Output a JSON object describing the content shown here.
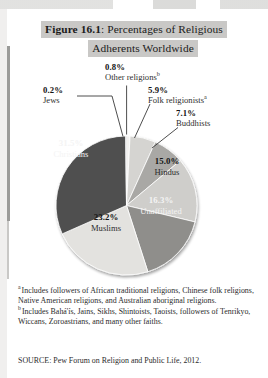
{
  "figure": {
    "title_label": "Figure 16.1",
    "title_rest": ": Percentages of Religious",
    "title_line2": "Adherents Worldwide"
  },
  "chart_data": {
    "type": "pie",
    "title": "Figure 16.1: Percentages of Religious Adherents Worldwide",
    "units": "percent",
    "legend": "none",
    "labels_inside": [
      "Christians",
      "Muslims",
      "Unaffiliated",
      "Hindus"
    ],
    "labels_outside": [
      "Other religions",
      "Jews",
      "Folk religionists",
      "Buddhists"
    ],
    "categories": [
      "Other religions",
      "Folk religionists",
      "Buddhists",
      "Hindus",
      "Unaffiliated",
      "Muslims",
      "Christians",
      "Jews"
    ],
    "values": [
      0.8,
      5.9,
      7.1,
      15.0,
      16.3,
      23.2,
      31.5,
      0.2
    ],
    "colors": [
      "#f2f1ef",
      "#d5d4d1",
      "#a9a8a5",
      "#cfcecb",
      "#8f8e8b",
      "#e3e2df",
      "#4f4f4f",
      "#3a3a3a"
    ],
    "start_angle_deg": 0,
    "direction": "clockwise",
    "slices": [
      {
        "name": "Other religions",
        "value": 0.8,
        "display": "0.8%",
        "footnote": "b",
        "color": "#f2f1ef",
        "label_placement": "outside"
      },
      {
        "name": "Folk religionists",
        "value": 5.9,
        "display": "5.9%",
        "footnote": "a",
        "color": "#d5d4d1",
        "label_placement": "outside"
      },
      {
        "name": "Buddhists",
        "value": 7.1,
        "display": "7.1%",
        "footnote": "",
        "color": "#a9a8a5",
        "label_placement": "outside"
      },
      {
        "name": "Hindus",
        "value": 15.0,
        "display": "15.0%",
        "footnote": "",
        "color": "#cfcecb",
        "label_placement": "inside"
      },
      {
        "name": "Unaffiliated",
        "value": 16.3,
        "display": "16.3%",
        "footnote": "",
        "color": "#8f8e8b",
        "label_placement": "inside"
      },
      {
        "name": "Muslims",
        "value": 23.2,
        "display": "23.2%",
        "footnote": "",
        "color": "#e3e2df",
        "label_placement": "inside"
      },
      {
        "name": "Christians",
        "value": 31.5,
        "display": "31.5%",
        "footnote": "",
        "color": "#4f4f4f",
        "label_placement": "inside"
      },
      {
        "name": "Jews",
        "value": 0.2,
        "display": "0.2%",
        "footnote": "",
        "color": "#3a3a3a",
        "label_placement": "outside"
      }
    ]
  },
  "callouts": {
    "other": {
      "pct": "0.8%",
      "name": "Other religions",
      "sup": "b"
    },
    "jews": {
      "pct": "0.2%",
      "name": "Jews",
      "sup": ""
    },
    "folk": {
      "pct": "5.9%",
      "name": "Folk religionists",
      "sup": "a"
    },
    "buddhists": {
      "pct": "7.1%",
      "name": "Buddhists",
      "sup": ""
    }
  },
  "slice_labels": {
    "christians": {
      "pct": "31.5%",
      "name": "Christians"
    },
    "muslims": {
      "pct": "23.2%",
      "name": "Muslims"
    },
    "unaffiliated": {
      "pct": "16.3%",
      "name": "Unaffiliated"
    },
    "hindus": {
      "pct": "15.0%",
      "name": "Hindus"
    }
  },
  "footnotes": [
    {
      "marker": "a",
      "text": "Includes followers of African traditional religions, Chinese folk religions, Native American religions, and Australian aboriginal religions."
    },
    {
      "marker": "b",
      "text": "Includes Bahá'ís, Jains, Sikhs, Shintoists, Taoists, followers of Tenrikyo, Wiccans, Zoroastrians, and many other faiths."
    }
  ],
  "source": "SOURCE: Pew Forum on Religion and Public Life, 2012."
}
